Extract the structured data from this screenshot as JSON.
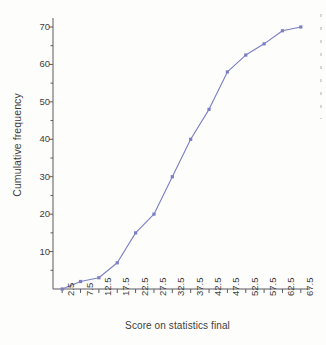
{
  "chart_data": {
    "type": "line",
    "title": "",
    "xlabel": "Score on statistics final",
    "ylabel": "Cumulative frequency",
    "x": [
      2.5,
      7.5,
      12.5,
      17.5,
      22.5,
      27.5,
      32.5,
      37.5,
      42.5,
      47.5,
      52.5,
      57.5,
      62.5,
      67.5
    ],
    "values": [
      0,
      2,
      3,
      7,
      15,
      20,
      30,
      40,
      48,
      58,
      62.5,
      65.5,
      69,
      70
    ],
    "xtick_labels": [
      "2.5",
      "7.5",
      "12.5",
      "17.5",
      "22.5",
      "27.5",
      "32.5",
      "37.5",
      "42.5",
      "47.5",
      "52.5",
      "57.5",
      "62.5",
      "67.5"
    ],
    "ytick_labels": [
      "10",
      "20",
      "30",
      "40",
      "50",
      "60",
      "70"
    ],
    "ytick_values": [
      10,
      20,
      30,
      40,
      50,
      60,
      70
    ],
    "yminor_values": [
      5,
      15,
      25,
      35,
      45,
      55,
      65
    ],
    "xlim": [
      0,
      70
    ],
    "ylim": [
      0,
      73
    ],
    "grid": false,
    "legend": null,
    "series_color": "#7b7fc4",
    "marker": "square",
    "axis_color": "#5a5a60",
    "background": "#fdfdfc"
  }
}
